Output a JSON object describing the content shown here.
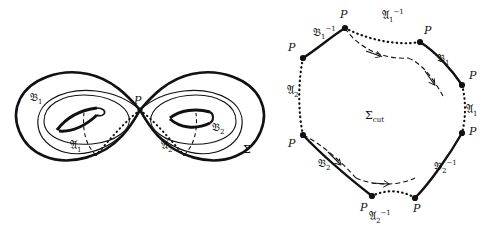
{
  "figure": {
    "type": "mathematical-diagram",
    "panels": [
      {
        "name": "surface",
        "title_label": "Σ",
        "basepoint_label": "P",
        "curve_labels": [
          "𝔅₁",
          "𝔅₂",
          "𝔄₁",
          "𝔄₂"
        ]
      },
      {
        "name": "cut-octagon",
        "title_label": "Σ",
        "title_sub": "cut",
        "basepoint_label": "P"
      }
    ]
  },
  "left_panel": {
    "labels": {
      "B1": "𝔅",
      "B1_sub": "1",
      "B2": "𝔅",
      "B2_sub": "2",
      "A1": "𝔄",
      "A1_sub": "1",
      "A2": "𝔄",
      "A2_sub": "2",
      "P": "P",
      "Sigma": "Σ"
    }
  },
  "right_panel": {
    "center_label": "Σ",
    "center_sub": "cut",
    "vertex_label": "P",
    "edges": [
      {
        "id": "edge-B1-inv",
        "base": "𝔅",
        "sub": "1",
        "sup": "−1",
        "style": "solid"
      },
      {
        "id": "edge-A1-inv",
        "base": "𝔄",
        "sub": "1",
        "sup": "−1",
        "style": "dotted"
      },
      {
        "id": "edge-B1",
        "base": "𝔅",
        "sub": "1",
        "sup": "",
        "style": "solid"
      },
      {
        "id": "edge-A1",
        "base": "𝔄",
        "sub": "1",
        "sup": "",
        "style": "dotted"
      },
      {
        "id": "edge-B2-inv",
        "base": "𝔅",
        "sub": "2",
        "sup": "−1",
        "style": "solid"
      },
      {
        "id": "edge-A2-inv",
        "base": "𝔄",
        "sub": "2",
        "sup": "−1",
        "style": "dotted"
      },
      {
        "id": "edge-B2",
        "base": "𝔅",
        "sub": "2",
        "sup": "",
        "style": "solid"
      },
      {
        "id": "edge-A2",
        "base": "𝔄",
        "sub": "2",
        "sup": "",
        "style": "dotted"
      }
    ],
    "vertex_count": 8,
    "interior_arcs": 2
  },
  "colors": {
    "ink": "#111111",
    "background": "#ffffff"
  }
}
